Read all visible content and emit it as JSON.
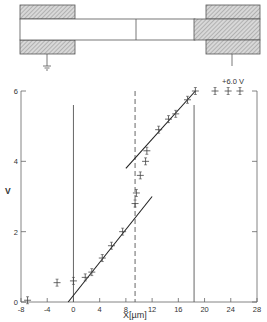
{
  "diagram": {
    "ground_label": "",
    "voltage_label": "+6.0 V"
  },
  "chart_data": {
    "type": "scatter",
    "title": "",
    "xlabel": "X[µm]",
    "ylabel": "V",
    "xlim": [
      -8,
      28
    ],
    "ylim": [
      0,
      6
    ],
    "x_ticks": [
      "-8",
      "-4",
      "0",
      "4",
      "8",
      "12",
      "16",
      "20",
      "24",
      "28"
    ],
    "y_ticks": [
      "0",
      "2",
      "4",
      "6"
    ],
    "grid": false,
    "legend": null,
    "series": [
      {
        "name": "measured",
        "points": [
          [
            -7.0,
            0.05
          ],
          [
            -2.5,
            0.55
          ],
          [
            0.0,
            0.6
          ],
          [
            1.8,
            0.7
          ],
          [
            2.8,
            0.85
          ],
          [
            4.4,
            1.25
          ],
          [
            5.8,
            1.6
          ],
          [
            7.5,
            2.0
          ],
          [
            9.4,
            2.8
          ],
          [
            9.6,
            3.1
          ],
          [
            10.2,
            3.6
          ],
          [
            11.0,
            4.0
          ],
          [
            11.2,
            4.3
          ],
          [
            13.0,
            4.9
          ],
          [
            14.5,
            5.2
          ],
          [
            15.6,
            5.35
          ],
          [
            17.4,
            5.75
          ],
          [
            18.6,
            6.0
          ],
          [
            21.6,
            6.0
          ],
          [
            23.6,
            6.0
          ],
          [
            25.4,
            6.0
          ]
        ]
      }
    ],
    "fit_lines": [
      {
        "name": "lower fit",
        "from": [
          -0.8,
          0.0
        ],
        "to": [
          12.0,
          3.0
        ]
      },
      {
        "name": "upper fit",
        "from": [
          8.0,
          3.8
        ],
        "to": [
          18.6,
          6.0
        ]
      }
    ],
    "reference_lines": [
      {
        "type": "solid",
        "x": 0.0
      },
      {
        "type": "dashed",
        "x": 9.4
      },
      {
        "type": "solid",
        "x": 18.4
      }
    ]
  }
}
